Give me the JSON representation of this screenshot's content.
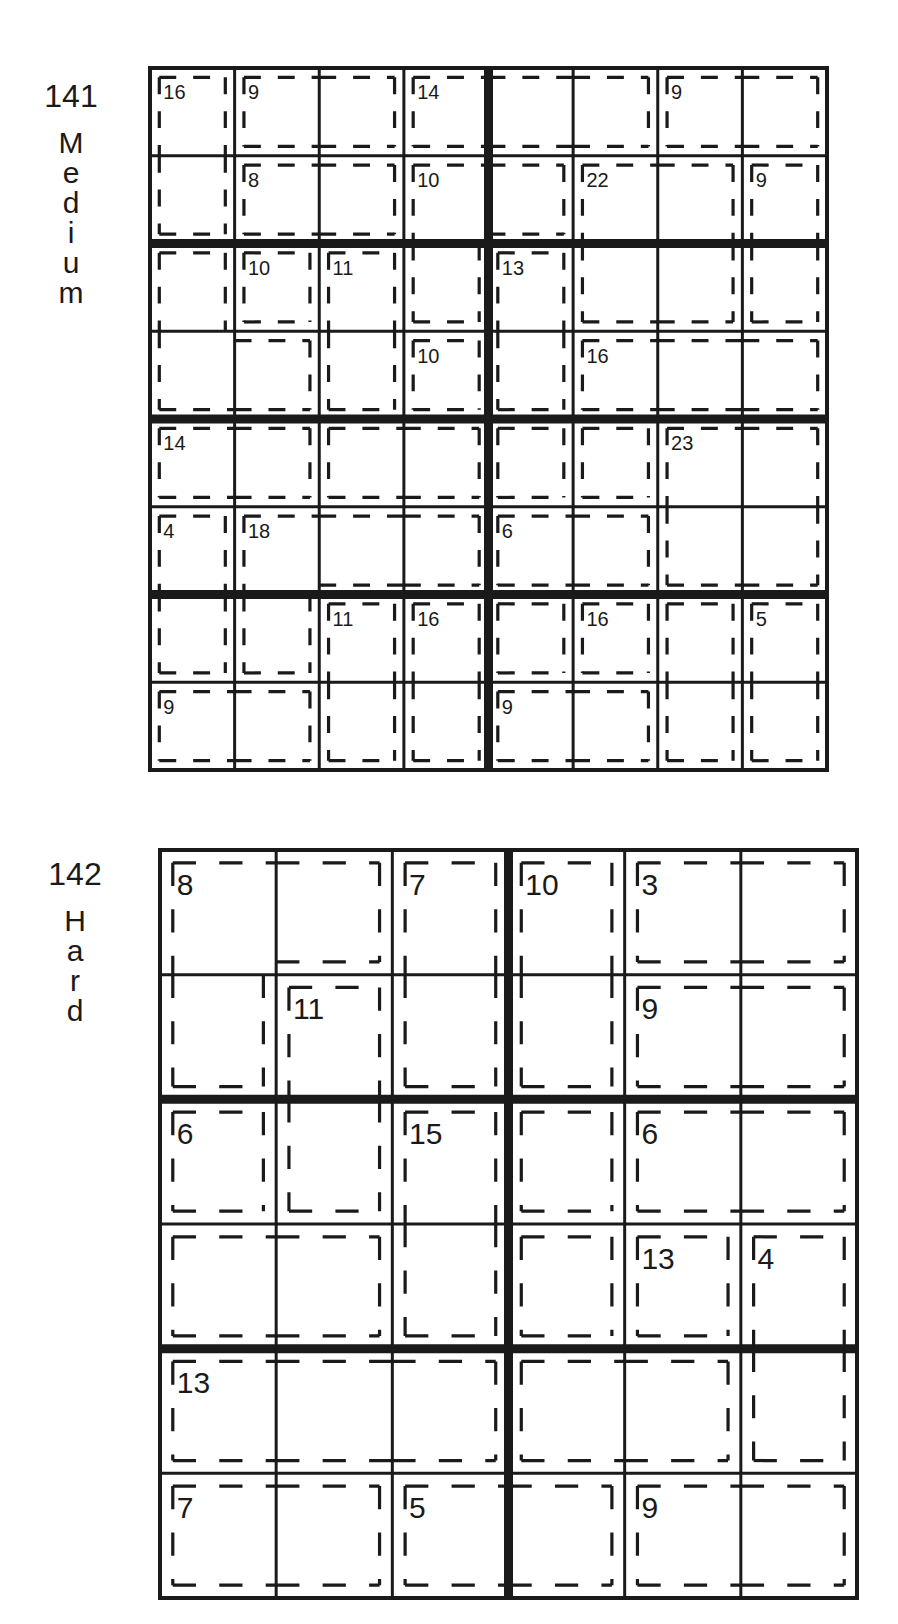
{
  "puzzles": [
    {
      "number": "141",
      "difficulty": "Medium",
      "difficulty_letters": [
        "M",
        "e",
        "d",
        "i",
        "u",
        "m"
      ],
      "size": 8,
      "box_w": 4,
      "box_h": 2,
      "cages": [
        [
          "A",
          "B",
          "B",
          "C",
          "C",
          "C",
          "D",
          "D"
        ],
        [
          "A",
          "E",
          "E",
          "F",
          "F",
          "H",
          "H",
          "I"
        ],
        [
          "J",
          "K",
          "L",
          "F",
          "M",
          "H",
          "H",
          "I"
        ],
        [
          "J",
          "J",
          "L",
          "N",
          "M",
          "O",
          "O",
          "O"
        ],
        [
          "P",
          "P",
          "Q",
          "Q",
          "R",
          "S",
          "T",
          "T"
        ],
        [
          "U",
          "V",
          "V",
          "V",
          "W",
          "W",
          "T",
          "T"
        ],
        [
          "U",
          "V",
          "X",
          "Y",
          "Z",
          "a",
          "Z2",
          "b"
        ],
        [
          "c",
          "c",
          "X",
          "Y",
          "d",
          "d",
          "Z2",
          "b"
        ]
      ],
      "clues": [
        {
          "r": 0,
          "c": 0,
          "v": "16"
        },
        {
          "r": 0,
          "c": 1,
          "v": "9"
        },
        {
          "r": 0,
          "c": 3,
          "v": "14"
        },
        {
          "r": 0,
          "c": 6,
          "v": "9"
        },
        {
          "r": 1,
          "c": 1,
          "v": "8"
        },
        {
          "r": 1,
          "c": 3,
          "v": "10"
        },
        {
          "r": 1,
          "c": 5,
          "v": "22"
        },
        {
          "r": 1,
          "c": 7,
          "v": "9"
        },
        {
          "r": 2,
          "c": 1,
          "v": "10"
        },
        {
          "r": 2,
          "c": 2,
          "v": "11"
        },
        {
          "r": 2,
          "c": 4,
          "v": "13"
        },
        {
          "r": 3,
          "c": 3,
          "v": "10"
        },
        {
          "r": 3,
          "c": 5,
          "v": "16"
        },
        {
          "r": 4,
          "c": 0,
          "v": "14"
        },
        {
          "r": 4,
          "c": 6,
          "v": "23"
        },
        {
          "r": 5,
          "c": 0,
          "v": "4"
        },
        {
          "r": 5,
          "c": 1,
          "v": "18"
        },
        {
          "r": 5,
          "c": 4,
          "v": "6"
        },
        {
          "r": 6,
          "c": 2,
          "v": "11"
        },
        {
          "r": 6,
          "c": 3,
          "v": "16"
        },
        {
          "r": 6,
          "c": 5,
          "v": "16"
        },
        {
          "r": 6,
          "c": 7,
          "v": "5"
        },
        {
          "r": 7,
          "c": 0,
          "v": "9"
        },
        {
          "r": 7,
          "c": 4,
          "v": "9"
        }
      ]
    },
    {
      "number": "142",
      "difficulty": "Hard",
      "difficulty_letters": [
        "H",
        "a",
        "r",
        "d"
      ],
      "size": 6,
      "box_w": 3,
      "box_h": 2,
      "cages": [
        [
          "A",
          "A",
          "B",
          "C",
          "D",
          "D"
        ],
        [
          "A",
          "E",
          "B",
          "C",
          "F",
          "F"
        ],
        [
          "G",
          "E",
          "H",
          "I",
          "J",
          "J"
        ],
        [
          "K",
          "K",
          "H",
          "L",
          "M",
          "N"
        ],
        [
          "O",
          "O",
          "O",
          "P",
          "P",
          "N"
        ],
        [
          "Q",
          "Q",
          "R",
          "R",
          "S",
          "S"
        ]
      ],
      "clues": [
        {
          "r": 0,
          "c": 0,
          "v": "8"
        },
        {
          "r": 0,
          "c": 2,
          "v": "7"
        },
        {
          "r": 0,
          "c": 3,
          "v": "10"
        },
        {
          "r": 0,
          "c": 4,
          "v": "3"
        },
        {
          "r": 1,
          "c": 1,
          "v": "11"
        },
        {
          "r": 1,
          "c": 4,
          "v": "9"
        },
        {
          "r": 2,
          "c": 0,
          "v": "6"
        },
        {
          "r": 2,
          "c": 2,
          "v": "15"
        },
        {
          "r": 2,
          "c": 4,
          "v": "6"
        },
        {
          "r": 3,
          "c": 4,
          "v": "13"
        },
        {
          "r": 3,
          "c": 5,
          "v": "4"
        },
        {
          "r": 4,
          "c": 0,
          "v": "13"
        },
        {
          "r": 5,
          "c": 0,
          "v": "7"
        },
        {
          "r": 5,
          "c": 2,
          "v": "5"
        },
        {
          "r": 5,
          "c": 4,
          "v": "9"
        }
      ]
    }
  ],
  "style": {
    "ink": "#1a1a1a",
    "paper": "#ffffff"
  }
}
